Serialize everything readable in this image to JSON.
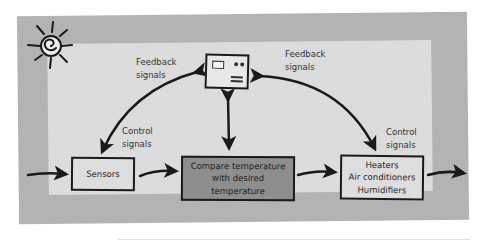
{
  "diagram": {
    "type": "thermostat-feedback-control-loop",
    "decorations": {
      "sun_icon": "sun-icon",
      "thermostat_icon": "thermostat-icon"
    },
    "labels": {
      "feedback_left": {
        "line1": "Feedback",
        "line2": "signals"
      },
      "feedback_right": {
        "line1": "Feedback",
        "line2": "signals"
      },
      "control_left": {
        "line1": "Control",
        "line2": "signals"
      },
      "control_right": {
        "line1": "Control",
        "line2": "signals"
      }
    },
    "boxes": {
      "sensors": {
        "lines": [
          "Sensors"
        ]
      },
      "compare": {
        "lines": [
          "Compare temperature",
          "with desired",
          "temperature"
        ]
      },
      "effectors": {
        "lines": [
          "Heaters",
          "Air conditioners",
          "Humidifiers"
        ]
      }
    },
    "colors": {
      "frame": "#b3b3b3",
      "panel": "#dcdcdc",
      "box_light": "#dedede",
      "box_dark": "#8e8e8e",
      "ink": "#1a1a1a"
    },
    "flow": [
      {
        "from": "input",
        "to": "sensors"
      },
      {
        "from": "sensors",
        "to": "compare"
      },
      {
        "from": "compare",
        "to": "effectors"
      },
      {
        "from": "effectors",
        "to": "output"
      },
      {
        "from": "thermostat",
        "to": "sensors",
        "kind": "control/feedback (bidirectional)"
      },
      {
        "from": "thermostat",
        "to": "compare",
        "kind": "bidirectional"
      },
      {
        "from": "thermostat",
        "to": "effectors",
        "kind": "control/feedback (bidirectional)"
      }
    ]
  }
}
